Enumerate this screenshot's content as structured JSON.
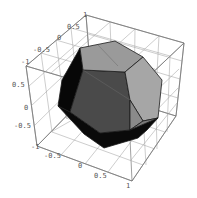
{
  "figure": {
    "type": "3d-plot",
    "colors": {
      "background": "#ffffff",
      "face_light": "#a8a8a8",
      "face_mid": "#8c8c8c",
      "face_dark": "#4a4a4a",
      "face_black": "#0a0a0a",
      "grid": "#9a9a9a"
    }
  },
  "axes": {
    "x_ticks": [
      "-1",
      "-0.5",
      "0",
      "0.5",
      "1"
    ],
    "y_ticks": [
      "-1",
      "-0.5",
      "0",
      "0.5",
      "1"
    ],
    "z_ticks": [
      "-0.5",
      "0",
      "0.5"
    ],
    "top_ticks": [
      "-1",
      "-0.5",
      "0",
      "0.5",
      "1"
    ],
    "bottom_ticks": [
      "-1",
      "-0.5",
      "0",
      "0.5",
      "1"
    ],
    "left_ticks": [
      "0.5",
      "0",
      "-0.5"
    ]
  }
}
